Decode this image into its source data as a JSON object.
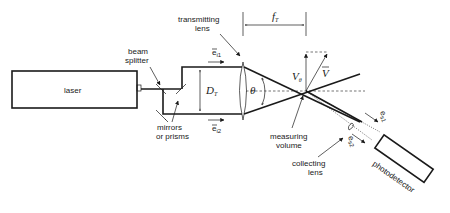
{
  "diagram": {
    "labels": {
      "laser": "laser",
      "beam_splitter_line1": "beam",
      "beam_splitter_line2": "splitter",
      "transmitting_lens_line1": "transmitting",
      "transmitting_lens_line2": "lens",
      "mirrors_line1": "mirrors",
      "mirrors_line2": "or prisms",
      "measuring_volume_line1": "measuring",
      "measuring_volume_line2": "volume",
      "collecting_lens_line1": "collecting",
      "collecting_lens_line2": "lens",
      "photodetector": "photodetector"
    },
    "symbols": {
      "beam_separation": "D",
      "beam_separation_sub": "T",
      "focal_length": "f",
      "focal_length_sub": "T",
      "angle": "θ",
      "velocity_component": "V",
      "velocity_component_sub": "θ",
      "velocity_vector": "V",
      "incident_1": "e",
      "incident_1_sub": "i1",
      "incident_2": "e",
      "incident_2_sub": "i2",
      "scattered_1": "e",
      "scattered_1_sub": "s1",
      "scattered_2": "e",
      "scattered_2_sub": "s2"
    }
  },
  "caption": {
    "visible": "partially cropped at bottom edge"
  }
}
